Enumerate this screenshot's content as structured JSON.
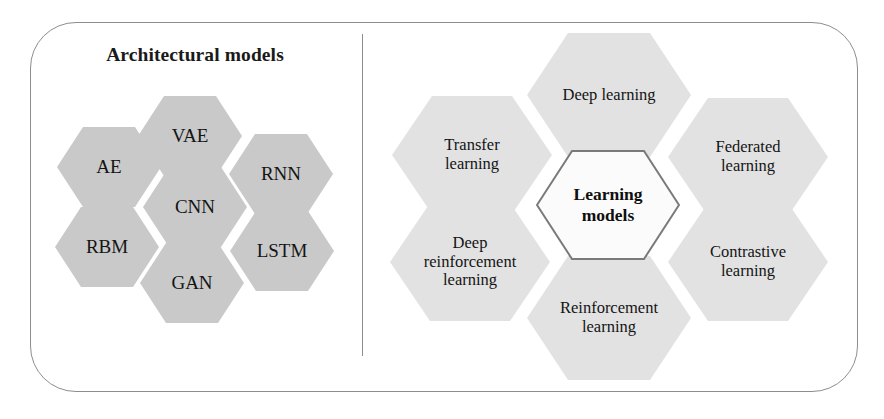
{
  "figure": {
    "background_color": "#ffffff",
    "frame": {
      "border_color": "#8d8d8d",
      "corner_radius_px": 46
    },
    "divider": {
      "name": "vertical-divider",
      "color": "#8d8d8d"
    }
  },
  "left_panel": {
    "title": "Architectural models",
    "hex_fill": "#c9c9c9",
    "hexagons": [
      {
        "id": "vae",
        "label": "VAE",
        "x": 138,
        "y": 96,
        "w": 104,
        "h": 80
      },
      {
        "id": "ae",
        "label": "AE",
        "x": 57,
        "y": 127,
        "w": 104,
        "h": 80
      },
      {
        "id": "rnn",
        "label": "RNN",
        "x": 229,
        "y": 134,
        "w": 104,
        "h": 80
      },
      {
        "id": "cnn",
        "label": "CNN",
        "x": 143,
        "y": 167,
        "w": 104,
        "h": 80
      },
      {
        "id": "rbm",
        "label": "RBM",
        "x": 55,
        "y": 207,
        "w": 104,
        "h": 80
      },
      {
        "id": "lstm",
        "label": "LSTM",
        "x": 230,
        "y": 211,
        "w": 104,
        "h": 80
      },
      {
        "id": "gan",
        "label": "GAN",
        "x": 140,
        "y": 243,
        "w": 104,
        "h": 80
      }
    ]
  },
  "right_panel": {
    "hex_fill": "#e2e2e2",
    "center": {
      "id": "learning-models",
      "label_line1": "Learning",
      "label_line2": "models",
      "fill": "#fbfbfb",
      "stroke": "#7a7a7a",
      "x": 536,
      "y": 150,
      "w": 144,
      "h": 110
    },
    "hexagons": [
      {
        "id": "deep-learning",
        "label": "Deep learning",
        "x": 527,
        "y": 33,
        "w": 164,
        "h": 124
      },
      {
        "id": "transfer-learning",
        "label": "Transfer\nlearning",
        "x": 392,
        "y": 96,
        "w": 160,
        "h": 118
      },
      {
        "id": "federated-learning",
        "label": "Federated\nlearning",
        "x": 668,
        "y": 98,
        "w": 160,
        "h": 118
      },
      {
        "id": "deep-reinforcement-learning",
        "label": "Deep\nreinforcement\nlearning",
        "x": 390,
        "y": 203,
        "w": 160,
        "h": 118
      },
      {
        "id": "contrastive-learning",
        "label": "Contrastive\nlearning",
        "x": 668,
        "y": 203,
        "w": 160,
        "h": 118
      },
      {
        "id": "reinforcement-learning",
        "label": "Reinforcement\nlearning",
        "x": 527,
        "y": 256,
        "w": 164,
        "h": 124
      }
    ]
  }
}
